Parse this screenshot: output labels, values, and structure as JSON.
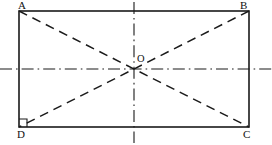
{
  "figure": {
    "type": "geometry-diagram",
    "colors": {
      "stroke": "#1a1a1a",
      "background": "#ffffff",
      "label": "#111111"
    },
    "canvas": {
      "width": 272,
      "height": 145
    },
    "rectangle": {
      "name": "rectangle-abcd",
      "x": 19,
      "y": 11,
      "width": 230,
      "height": 116,
      "stroke_width": 1.6
    },
    "center": {
      "name": "point-o",
      "x": 134,
      "y": 69
    },
    "vertices": [
      {
        "id": "A",
        "label": "A",
        "x": 19,
        "y": 11,
        "label_x": 18,
        "label_y": 0,
        "corner": "top-left"
      },
      {
        "id": "B",
        "label": "B",
        "x": 249,
        "y": 11,
        "label_x": 240,
        "label_y": 0,
        "corner": "top-right"
      },
      {
        "id": "C",
        "label": "C",
        "x": 249,
        "y": 127,
        "label_x": 243,
        "label_y": 129,
        "corner": "bottom-right"
      },
      {
        "id": "D",
        "label": "D",
        "x": 19,
        "y": 127,
        "label_x": 17,
        "label_y": 129,
        "corner": "bottom-left"
      }
    ],
    "center_label": {
      "text": "O",
      "x": 137,
      "y": 54
    },
    "diagonals": [
      {
        "name": "diagonal-a-c",
        "x1": 19,
        "y1": 11,
        "x2": 249,
        "y2": 127,
        "style": "dashed"
      },
      {
        "name": "diagonal-b-d",
        "x1": 249,
        "y1": 11,
        "x2": 19,
        "y2": 127,
        "style": "dashed"
      }
    ],
    "axes": [
      {
        "name": "horizontal-axis-of-symmetry",
        "x1": 0,
        "y1": 69,
        "x2": 272,
        "y2": 69,
        "style": "dash-dot"
      },
      {
        "name": "vertical-axis-of-symmetry",
        "x1": 134,
        "y1": 2,
        "x2": 134,
        "y2": 143,
        "style": "dash-dot"
      }
    ],
    "right_angle_mark": {
      "name": "right-angle-mark-d",
      "vertex": "D",
      "x": 19,
      "y": 127,
      "size": 8
    },
    "dash_patterns": {
      "diagonal": "9 6",
      "axis": "12 4 1.6 4"
    }
  }
}
